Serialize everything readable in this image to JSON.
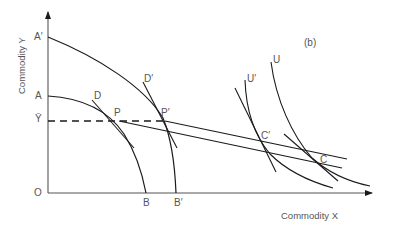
{
  "figure": {
    "panel_label": "(b)",
    "x_axis_title": "Commodity X",
    "y_axis_title": "Commodity Y",
    "origin_label": "O",
    "y_axis_points": {
      "a_prime": "A′",
      "a": "A",
      "y_bar": "Ȳ"
    },
    "x_axis_points": {
      "b": "B",
      "b_prime": "B′"
    },
    "curve_labels": {
      "d": "D",
      "d_prime": "D′",
      "p": "P",
      "p_prime": "P′",
      "u": "U",
      "u_prime": "U′",
      "c": "C",
      "c_prime": "C′"
    }
  },
  "colors": {
    "line": "#1a1a1a",
    "text": "#555555"
  }
}
